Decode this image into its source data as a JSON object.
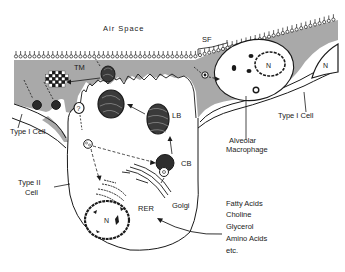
{
  "figure": {
    "type": "schematic diagram"
  },
  "labels": {
    "air_space": "Air Space",
    "sf": "SF",
    "tm": "TM",
    "lb": "LB",
    "cb": "CB",
    "rer": "RER",
    "golgi": "Golgi",
    "nucleus": "N",
    "nucleus_macrophage": "N",
    "nucleus_type1": "N",
    "question": "?",
    "type1_cell_left": "Type I Cell",
    "type1_cell_right": "Type I Cell",
    "type2_cell_line1": "Type II",
    "type2_cell_line2": "Cell",
    "macrophage_line1": "Alveolar",
    "macrophage_line2": "Macrophage",
    "precursors": [
      "Fatty Acids",
      "Choline",
      "Glycerol",
      "Amino Acids",
      "etc."
    ]
  },
  "colors": {
    "hypophase": "#a9a9a9",
    "ink": "#1a1a1a",
    "background": "#ffffff"
  }
}
